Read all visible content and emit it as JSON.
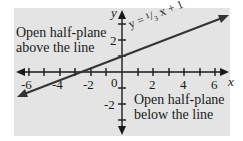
{
  "diagram": {
    "equation_label": "y = ¹/₃ x + 1",
    "region_above": {
      "line1": "Open half-plane",
      "line2": "above the line"
    },
    "region_below": {
      "line1": "Open half-plane",
      "line2": "below the line"
    },
    "axes": {
      "x_name": "x",
      "y_name": "y",
      "x_tick_labels": [
        "-6",
        "-4",
        "-2",
        "0",
        "2",
        "4",
        "6"
      ],
      "y_tick_labels": [
        "2",
        "-2"
      ]
    },
    "line": {
      "slope": "1/3",
      "intercept": 1
    },
    "colors": {
      "background": "#e4e4e4",
      "ink": "#1a1a1a"
    }
  }
}
